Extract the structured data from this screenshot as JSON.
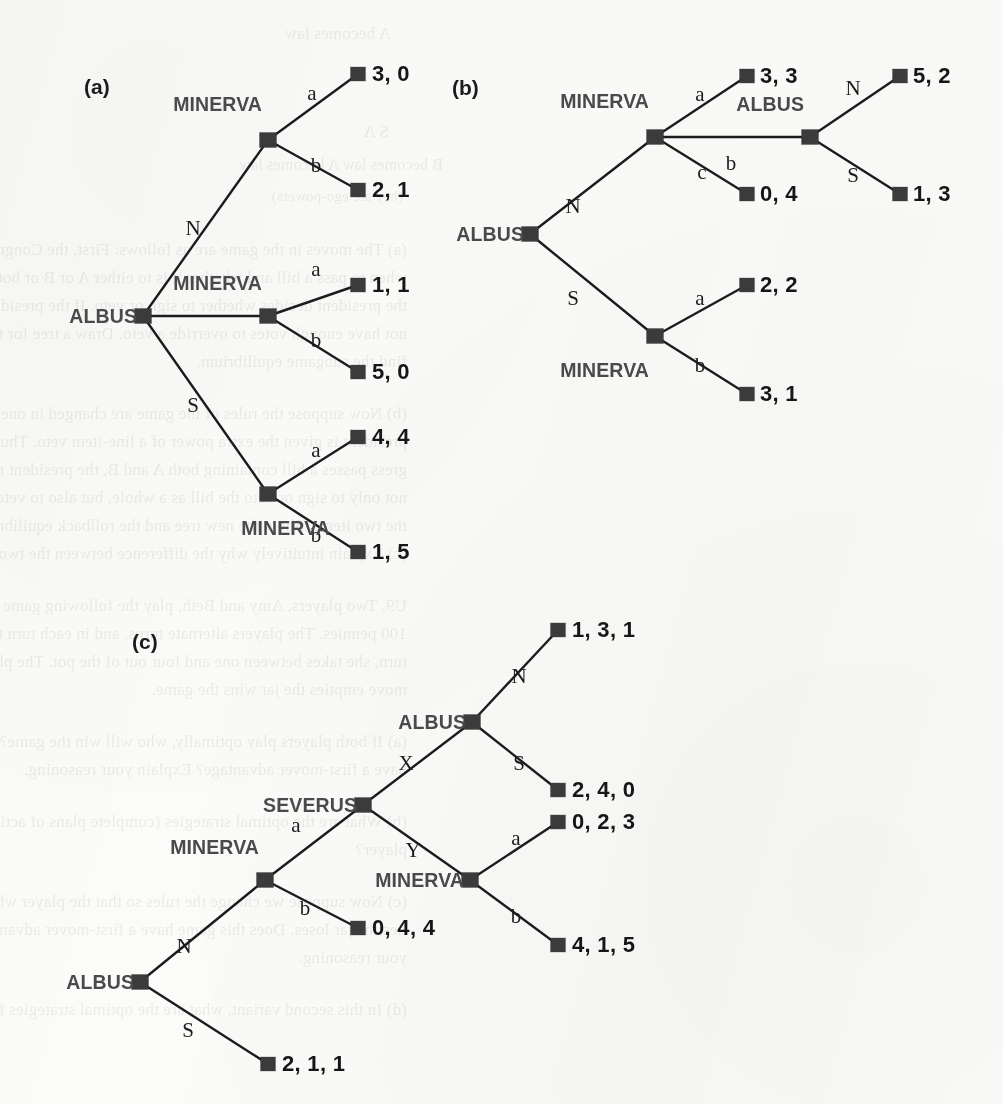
{
  "figure": {
    "type": "game-tree-diagram",
    "panels": [
      {
        "tag": "(a)",
        "tag_x": 84,
        "tag_y": 75,
        "players": [
          "ALBUS",
          "MINERVA"
        ],
        "nodes": [
          {
            "id": "a-root",
            "x": 143,
            "y": 316,
            "player": "ALBUS",
            "label_x": 137,
            "label_y": 316
          },
          {
            "id": "a-m1",
            "x": 268,
            "y": 140,
            "player": "MINERVA",
            "label_x": 262,
            "label_y": 104
          },
          {
            "id": "a-m2",
            "x": 268,
            "y": 316,
            "player": "MINERVA",
            "label_x": 262,
            "label_y": 283
          },
          {
            "id": "a-m3",
            "x": 268,
            "y": 494,
            "player": "MINERVA",
            "label_x": 330,
            "label_y": 528
          }
        ],
        "edges": [
          {
            "from": "a-root",
            "to": "a-m1",
            "label": "N",
            "lx": 193,
            "ly": 228
          },
          {
            "from": "a-root",
            "to": "a-m3",
            "label": "S",
            "lx": 193,
            "ly": 405
          },
          {
            "from": "a-root",
            "to": "a-m2",
            "label": "",
            "lx": 0,
            "ly": 0
          },
          {
            "from": "a-m1",
            "to": "t-a1",
            "label": "a",
            "lx": 312,
            "ly": 93
          },
          {
            "from": "a-m1",
            "to": "t-a2",
            "label": "b",
            "lx": 316,
            "ly": 165
          },
          {
            "from": "a-m2",
            "to": "t-a3",
            "label": "a",
            "lx": 316,
            "ly": 269
          },
          {
            "from": "a-m2",
            "to": "t-a4",
            "label": "b",
            "lx": 316,
            "ly": 340
          },
          {
            "from": "a-m3",
            "to": "t-a5",
            "label": "a",
            "lx": 316,
            "ly": 450
          },
          {
            "from": "a-m3",
            "to": "t-a6",
            "label": "b",
            "lx": 316,
            "ly": 535
          }
        ],
        "terminals": [
          {
            "id": "t-a1",
            "x": 358,
            "y": 74,
            "payoff": "3, 0",
            "tx": 372,
            "ty": 74
          },
          {
            "id": "t-a2",
            "x": 358,
            "y": 190,
            "payoff": "2, 1",
            "tx": 372,
            "ty": 190
          },
          {
            "id": "t-a3",
            "x": 358,
            "y": 285,
            "payoff": "1, 1",
            "tx": 372,
            "ty": 285
          },
          {
            "id": "t-a4",
            "x": 358,
            "y": 372,
            "payoff": "5, 0",
            "tx": 372,
            "ty": 372
          },
          {
            "id": "t-a5",
            "x": 358,
            "y": 437,
            "payoff": "4, 4",
            "tx": 372,
            "ty": 437
          },
          {
            "id": "t-a6",
            "x": 358,
            "y": 552,
            "payoff": "1, 5",
            "tx": 372,
            "ty": 552
          }
        ]
      },
      {
        "tag": "(b)",
        "tag_x": 452,
        "tag_y": 76,
        "players": [
          "ALBUS",
          "MINERVA"
        ],
        "nodes": [
          {
            "id": "b-root",
            "x": 530,
            "y": 234,
            "player": "ALBUS",
            "label_x": 524,
            "label_y": 234
          },
          {
            "id": "b-m1",
            "x": 655,
            "y": 137,
            "player": "MINERVA",
            "label_x": 649,
            "label_y": 101
          },
          {
            "id": "b-alb2",
            "x": 810,
            "y": 137,
            "player": "ALBUS",
            "label_x": 804,
            "label_y": 104
          },
          {
            "id": "b-m2",
            "x": 655,
            "y": 336,
            "player": "MINERVA",
            "label_x": 649,
            "label_y": 370
          }
        ],
        "edges": [
          {
            "from": "b-root",
            "to": "b-m1",
            "label": "N",
            "lx": 573,
            "ly": 206
          },
          {
            "from": "b-root",
            "to": "b-m2",
            "label": "S",
            "lx": 573,
            "ly": 298
          },
          {
            "from": "b-m1",
            "to": "t-b1",
            "label": "a",
            "lx": 700,
            "ly": 94
          },
          {
            "from": "b-m1",
            "to": "b-alb2",
            "label": "b",
            "lx": 731,
            "ly": 163
          },
          {
            "from": "b-m1",
            "to": "t-b2",
            "label": "c",
            "lx": 702,
            "ly": 172
          },
          {
            "from": "b-alb2",
            "to": "t-b3",
            "label": "N",
            "lx": 853,
            "ly": 88
          },
          {
            "from": "b-alb2",
            "to": "t-b4",
            "label": "S",
            "lx": 853,
            "ly": 175
          },
          {
            "from": "b-m2",
            "to": "t-b5",
            "label": "a",
            "lx": 700,
            "ly": 298
          },
          {
            "from": "b-m2",
            "to": "t-b6",
            "label": "b",
            "lx": 700,
            "ly": 365
          }
        ],
        "terminals": [
          {
            "id": "t-b1",
            "x": 747,
            "y": 76,
            "payoff": "3, 3",
            "tx": 760,
            "ty": 76
          },
          {
            "id": "t-b2",
            "x": 747,
            "y": 194,
            "payoff": "0, 4",
            "tx": 760,
            "ty": 194
          },
          {
            "id": "t-b3",
            "x": 900,
            "y": 76,
            "payoff": "5, 2",
            "tx": 913,
            "ty": 76
          },
          {
            "id": "t-b4",
            "x": 900,
            "y": 194,
            "payoff": "1, 3",
            "tx": 913,
            "ty": 194
          },
          {
            "id": "t-b5",
            "x": 747,
            "y": 285,
            "payoff": "2, 2",
            "tx": 760,
            "ty": 285
          },
          {
            "id": "t-b6",
            "x": 747,
            "y": 394,
            "payoff": "3, 1",
            "tx": 760,
            "ty": 394
          }
        ]
      },
      {
        "tag": "(c)",
        "tag_x": 132,
        "tag_y": 630,
        "players": [
          "ALBUS",
          "MINERVA",
          "SEVERUS"
        ],
        "nodes": [
          {
            "id": "c-root",
            "x": 140,
            "y": 982,
            "player": "ALBUS",
            "label_x": 134,
            "label_y": 982
          },
          {
            "id": "c-m1",
            "x": 265,
            "y": 880,
            "player": "MINERVA",
            "label_x": 259,
            "label_y": 847
          },
          {
            "id": "c-sev",
            "x": 363,
            "y": 805,
            "player": "SEVERUS",
            "label_x": 357,
            "label_y": 805
          },
          {
            "id": "c-alb2",
            "x": 472,
            "y": 722,
            "player": "ALBUS",
            "label_x": 466,
            "label_y": 722
          },
          {
            "id": "c-m2",
            "x": 470,
            "y": 880,
            "player": "MINERVA",
            "label_x": 464,
            "label_y": 880
          }
        ],
        "edges": [
          {
            "from": "c-root",
            "to": "c-m1",
            "label": "N",
            "lx": 184,
            "ly": 946
          },
          {
            "from": "c-root",
            "to": "t-c5",
            "label": "S",
            "lx": 188,
            "ly": 1030
          },
          {
            "from": "c-m1",
            "to": "c-sev",
            "label": "a",
            "lx": 296,
            "ly": 825
          },
          {
            "from": "c-m1",
            "to": "t-c4",
            "label": "b",
            "lx": 305,
            "ly": 908
          },
          {
            "from": "c-sev",
            "to": "c-alb2",
            "label": "X",
            "lx": 406,
            "ly": 763
          },
          {
            "from": "c-sev",
            "to": "c-m2",
            "label": "Y",
            "lx": 413,
            "ly": 850
          },
          {
            "from": "c-alb2",
            "to": "t-c1",
            "label": "N",
            "lx": 519,
            "ly": 676
          },
          {
            "from": "c-alb2",
            "to": "t-c2",
            "label": "S",
            "lx": 519,
            "ly": 763
          },
          {
            "from": "c-m2",
            "to": "t-c3",
            "label": "a",
            "lx": 516,
            "ly": 838
          },
          {
            "from": "c-m2",
            "to": "t-c6",
            "label": "b",
            "lx": 516,
            "ly": 916
          }
        ],
        "terminals": [
          {
            "id": "t-c1",
            "x": 558,
            "y": 630,
            "payoff": "1, 3, 1",
            "tx": 572,
            "ty": 630
          },
          {
            "id": "t-c2",
            "x": 558,
            "y": 790,
            "payoff": "2, 4, 0",
            "tx": 572,
            "ty": 790
          },
          {
            "id": "t-c3",
            "x": 558,
            "y": 822,
            "payoff": "0, 2, 3",
            "tx": 572,
            "ty": 822
          },
          {
            "id": "t-c4",
            "x": 358,
            "y": 928,
            "payoff": "0, 4, 4",
            "tx": 372,
            "ty": 928
          },
          {
            "id": "t-c5",
            "x": 268,
            "y": 1064,
            "payoff": "2, 1, 1",
            "tx": 282,
            "ty": 1064
          },
          {
            "id": "t-c6",
            "x": 558,
            "y": 945,
            "payoff": "4, 1, 5",
            "tx": 572,
            "ty": 945
          }
        ]
      }
    ],
    "colors": {
      "node_fill": "#3b3b3b",
      "edge_stroke": "#1c1c1c",
      "player_label": "#4a4a4a",
      "payoff_text": "#161616",
      "page_background": "#fbfbfa"
    }
  },
  "bleed_text": [
    {
      "x": 612,
      "y": 24,
      "text": "A becomes law",
      "size": 17
    },
    {
      "x": 614,
      "y": 122,
      "text": "S                                     A",
      "size": 17
    },
    {
      "x": 560,
      "y": 156,
      "text": "B becomes law            A becomes law",
      "size": 16
    },
    {
      "x": 600,
      "y": 188,
      "text": "(hey are ego-powers)",
      "size": 15
    },
    {
      "x": 596,
      "y": 240,
      "text": "(a)   The moves in the game are as follows:   First, the Congress decides",
      "size": 17
    },
    {
      "x": 596,
      "y": 268,
      "text": "when to pass a bill and whether it is to either A or B or both. Then",
      "size": 17
    },
    {
      "x": 596,
      "y": 296,
      "text": "the president decides whether to sign or veto. If the president does",
      "size": 17
    },
    {
      "x": 596,
      "y": 324,
      "text": "not have enough votes to override a veto. Draw a tree for this game and",
      "size": 17
    },
    {
      "x": 596,
      "y": 352,
      "text": "find the subgame equilibrium.",
      "size": 17
    },
    {
      "x": 596,
      "y": 404,
      "text": "(b)   Now suppose the rules of the game are changed in one: the request that",
      "size": 17
    },
    {
      "x": 596,
      "y": 432,
      "text": "president is given the extra power of a line-item veto.  Thus if the Con-",
      "size": 17
    },
    {
      "x": 596,
      "y": 460,
      "text": "gress passes a bill containing both A and B, the president may choose",
      "size": 17
    },
    {
      "x": 596,
      "y": 488,
      "text": "not only to sign or veto the bill as a whole, but also to veto just one of",
      "size": 17
    },
    {
      "x": 596,
      "y": 516,
      "text": "the two items. Show the new tree and the rollback equilibrium.",
      "size": 17
    },
    {
      "x": 596,
      "y": 544,
      "text": "(c)   Explain intuitively why the difference between the two equilibria arises.",
      "size": 17
    },
    {
      "x": 596,
      "y": 596,
      "text": "U9. Two players, Amy and Beth, play the following game with a pre-endowed",
      "size": 17
    },
    {
      "x": 596,
      "y": 624,
      "text": "100 pennies. The players alternate turns, and in each turn there is a  player a",
      "size": 17
    },
    {
      "x": 596,
      "y": 652,
      "text": "turn, she takes between one and four out of the pot. The player who-a",
      "size": 17
    },
    {
      "x": 596,
      "y": 680,
      "text": "move empties the jar wins the game.",
      "size": 17
    },
    {
      "x": 596,
      "y": 732,
      "text": "(a)   If both players play optimally, who will win the game?  Does this game",
      "size": 17
    },
    {
      "x": 596,
      "y": 760,
      "text": "have a first-mover advantage? Explain your reasoning.",
      "size": 17
    },
    {
      "x": 596,
      "y": 812,
      "text": "(b)   What are the optimal strategies (complete plans of action) for each",
      "size": 17
    },
    {
      "x": 596,
      "y": 840,
      "text": "player?",
      "size": 17
    },
    {
      "x": 596,
      "y": 892,
      "text": "(c)   Now suppose we change the rules so that the player whose turn it is",
      "size": 17
    },
    {
      "x": 596,
      "y": 920,
      "text": "ties the jar loses. Does this game have a first-mover advantage? Explain",
      "size": 17
    },
    {
      "x": 596,
      "y": 948,
      "text": "your reasoning.",
      "size": 17
    },
    {
      "x": 596,
      "y": 1000,
      "text": "(d)   In this second variant, what are the optimal strategies for each player?",
      "size": 17
    }
  ]
}
